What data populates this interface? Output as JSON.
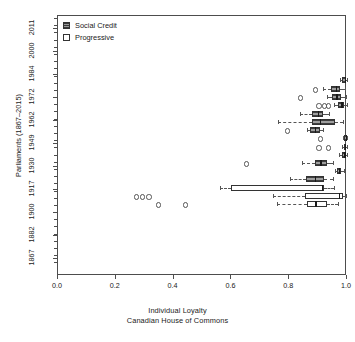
{
  "chart_data": {
    "type": "boxplot",
    "title": "",
    "xlabel": "Individual Loyalty",
    "subtitle": "Canadian House of Commons",
    "ylabel": "Parliaments (1867–2015)",
    "xlim": [
      0.0,
      1.0
    ],
    "xticks": [
      "0.0",
      "0.2",
      "0.4",
      "0.6",
      "0.8",
      "1.0"
    ],
    "xtick_values": [
      0.0,
      0.2,
      0.4,
      0.6,
      0.8,
      1.0
    ],
    "yticks": [
      "1867",
      "1882",
      "1900",
      "1917",
      "1930",
      "1949",
      "1962",
      "1972",
      "1984",
      "2000",
      "2011"
    ],
    "ytick_values": [
      1867,
      1882,
      1900,
      1917,
      1930,
      1949,
      1962,
      1972,
      1984,
      2000,
      2011
    ],
    "grid": false,
    "legend_position": "top-left",
    "legend": [
      {
        "label": "Social Credit",
        "key": "filled-square",
        "color": "#9e9e9e"
      },
      {
        "label": "Progressive",
        "key": "empty-square",
        "color": "#ffffff"
      }
    ],
    "series": [
      {
        "name": "Social Credit",
        "color": "#9e9e9e",
        "boxes": [
          {
            "row": 0,
            "y_px": 79,
            "whisker_low": 0.975,
            "q1": 0.982,
            "median": 0.992,
            "q3": 0.997,
            "whisker_high": 1.0,
            "outliers": []
          },
          {
            "row": 1,
            "y_px": 88,
            "whisker_low": 0.918,
            "q1": 0.945,
            "median": 0.962,
            "q3": 0.975,
            "whisker_high": 0.992,
            "outliers": [
              0.888
            ]
          },
          {
            "row": 2,
            "y_px": 96,
            "whisker_low": 0.93,
            "q1": 0.948,
            "median": 0.963,
            "q3": 0.978,
            "whisker_high": 0.995,
            "outliers": [
              0.835
            ]
          },
          {
            "row": 3,
            "y_px": 104,
            "whisker_low": 0.955,
            "q1": 0.968,
            "median": 0.98,
            "q3": 0.99,
            "whisker_high": 1.0,
            "outliers": [
              0.9,
              0.918,
              0.932
            ]
          },
          {
            "row": 4,
            "y_px": 113,
            "whisker_low": 0.838,
            "q1": 0.88,
            "median": 0.898,
            "q3": 0.918,
            "whisker_high": 0.938,
            "outliers": []
          },
          {
            "row": 5,
            "y_px": 121,
            "whisker_low": 0.762,
            "q1": 0.878,
            "median": 0.905,
            "q3": 0.958,
            "whisker_high": 0.985,
            "outliers": []
          },
          {
            "row": 6,
            "y_px": 129,
            "whisker_low": 0.862,
            "q1": 0.872,
            "median": 0.888,
            "q3": 0.905,
            "whisker_high": 0.918,
            "outliers": [
              0.79
            ]
          },
          {
            "row": 7,
            "y_px": 137,
            "whisker_low": 0.985,
            "q1": 0.99,
            "median": 0.995,
            "q3": 0.999,
            "whisker_high": 1.0,
            "outliers": [
              0.905
            ]
          },
          {
            "row": 8,
            "y_px": 146,
            "whisker_low": 0.982,
            "q1": 0.988,
            "median": 0.993,
            "q3": 0.998,
            "whisker_high": 1.0,
            "outliers": [
              0.9,
              0.932
            ]
          },
          {
            "row": 9,
            "y_px": 154,
            "whisker_low": 0.972,
            "q1": 0.982,
            "median": 0.99,
            "q3": 0.996,
            "whisker_high": 1.0,
            "outliers": []
          },
          {
            "row": 10,
            "y_px": 162,
            "whisker_low": 0.845,
            "q1": 0.888,
            "median": 0.908,
            "q3": 0.93,
            "whisker_high": 0.952,
            "outliers": [
              0.648
            ]
          },
          {
            "row": 11,
            "y_px": 170,
            "whisker_low": 0.958,
            "q1": 0.965,
            "median": 0.972,
            "q3": 0.98,
            "whisker_high": 0.988,
            "outliers": []
          },
          {
            "row": 12,
            "y_px": 178,
            "whisker_low": 0.802,
            "q1": 0.858,
            "median": 0.888,
            "q3": 0.92,
            "whisker_high": 0.952,
            "outliers": []
          }
        ]
      },
      {
        "name": "Progressive",
        "color": "#ffffff",
        "boxes": [
          {
            "row": 13,
            "y_px": 187,
            "whisker_low": 0.56,
            "q1": 0.6,
            "median": 0.912,
            "q3": 0.922,
            "whisker_high": 0.955,
            "outliers": []
          },
          {
            "row": 14,
            "y_px": 195,
            "whisker_low": 0.745,
            "q1": 0.855,
            "median": 0.972,
            "q3": 0.985,
            "whisker_high": 0.998,
            "outliers": [
              0.268,
              0.288,
              0.312
            ]
          },
          {
            "row": 15,
            "y_px": 203,
            "whisker_low": 0.758,
            "q1": 0.862,
            "median": 0.89,
            "q3": 0.932,
            "whisker_high": 0.968,
            "outliers": [
              0.345,
              0.438
            ]
          }
        ]
      }
    ]
  }
}
